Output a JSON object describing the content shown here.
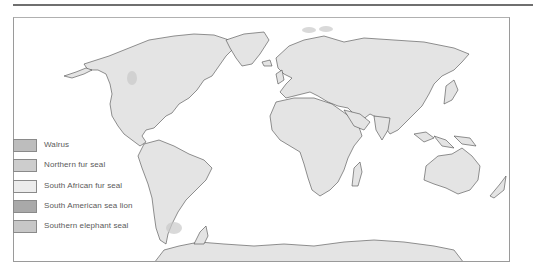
{
  "map": {
    "type": "world-map",
    "projection": "equirectangular-like",
    "land_color": "#e4e4e4",
    "coast_color": "#4a4a4a",
    "ocean_color": "#ffffff"
  },
  "legend": {
    "items": [
      {
        "label": "Walrus",
        "color": "#bdbdbd"
      },
      {
        "label": "Northern fur seal",
        "color": "#cdcdcd"
      },
      {
        "label": "South African fur seal",
        "color": "#ececec"
      },
      {
        "label": "South American sea lion",
        "color": "#a9a9a9"
      },
      {
        "label": "Southern elephant seal",
        "color": "#c7c7c7"
      }
    ]
  }
}
